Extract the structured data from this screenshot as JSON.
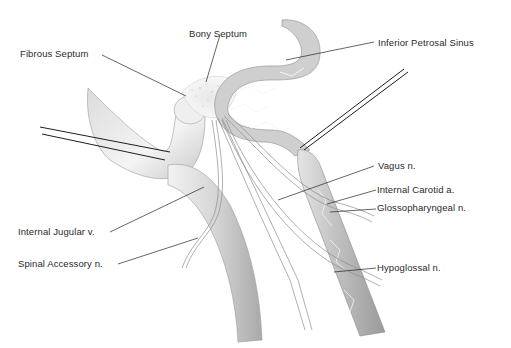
{
  "figure": {
    "colors": {
      "background": "#ffffff",
      "leader_line": "#222222",
      "vessel_shade": "#b8b8b8",
      "vessel_light": "#e6e6e6",
      "nerve_fill": "#f4f4f4",
      "outline": "#8a8a8a"
    }
  },
  "labels": {
    "bony_septum": "Bony Septum",
    "fibrous_septum": "Fibrous Septum",
    "inferior_petrosal_sinus": "Inferior Petrosal Sinus",
    "vagus": "Vagus n.",
    "internal_carotid": "Internal Carotid a.",
    "glossopharyngeal": "Glossopharyngeal n.",
    "internal_jugular": "Internal Jugular v.",
    "spinal_accessory": "Spinal Accessory n.",
    "hypoglossal": "Hypoglossal n."
  }
}
